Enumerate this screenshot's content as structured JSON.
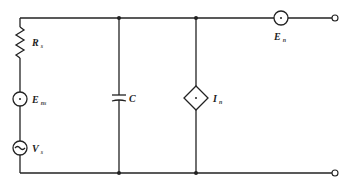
{
  "diagram": {
    "type": "circuit-noise-model",
    "components": {
      "source_resistance": {
        "symbol": "R",
        "subscript": "s"
      },
      "source_noise_voltage": {
        "symbol": "E",
        "subscript": "ns"
      },
      "signal_source": {
        "symbol": "V",
        "subscript": "s"
      },
      "capacitor": {
        "symbol": "C",
        "subscript": ""
      },
      "noise_current_source": {
        "symbol": "I",
        "subscript": "n"
      },
      "noise_voltage_source": {
        "symbol": "E",
        "subscript": "n"
      }
    },
    "colors": {
      "line": "#222222",
      "background": "#ffffff"
    }
  }
}
